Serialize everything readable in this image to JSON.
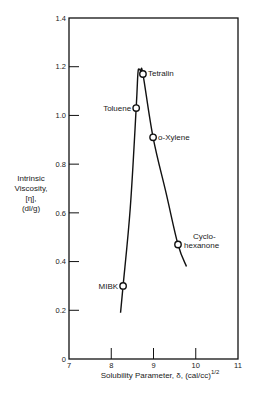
{
  "chart_data": {
    "type": "scatter",
    "title": "",
    "xlabel": "Solubility Parameter, δ, (cal/cc)",
    "xlabel_superscript": "1/2",
    "ylabel_lines": [
      "Intrinsic",
      "Viscosity,",
      "[η],",
      "(dl/g)"
    ],
    "xlim": [
      7,
      11
    ],
    "ylim": [
      0,
      1.4
    ],
    "x_ticks": [
      7,
      8,
      9,
      10,
      11
    ],
    "x_tick_labels": [
      "7",
      "8",
      "9",
      "10",
      "11"
    ],
    "y_ticks": [
      0,
      0.2,
      0.4,
      0.6,
      0.8,
      1.0,
      1.2,
      1.4
    ],
    "y_tick_labels": [
      "0",
      "0.2",
      "0.4",
      "0.6",
      "0.8",
      "1.0",
      "1.2",
      "1.4"
    ],
    "grid": false,
    "legend": null,
    "points": [
      {
        "label": "MIBK",
        "x": 8.28,
        "y": 0.3
      },
      {
        "label": "Toluene",
        "x": 8.59,
        "y": 1.03
      },
      {
        "label": "Tetralin",
        "x": 8.75,
        "y": 1.17
      },
      {
        "label": "o-Xylene",
        "x": 8.99,
        "y": 0.91
      },
      {
        "label": "Cyclohexanone",
        "label_lines": [
          "Cyclo-",
          "hexanone"
        ],
        "x": 9.58,
        "y": 0.47
      }
    ],
    "curve": {
      "name": "fitted curve",
      "x": [
        8.22,
        8.28,
        8.45,
        8.59,
        8.63,
        8.66,
        8.7,
        8.75,
        8.99,
        9.3,
        9.58,
        9.78
      ],
      "y": [
        0.19,
        0.3,
        0.62,
        1.03,
        1.17,
        1.19,
        1.18,
        1.17,
        0.91,
        0.68,
        0.47,
        0.38
      ]
    }
  }
}
